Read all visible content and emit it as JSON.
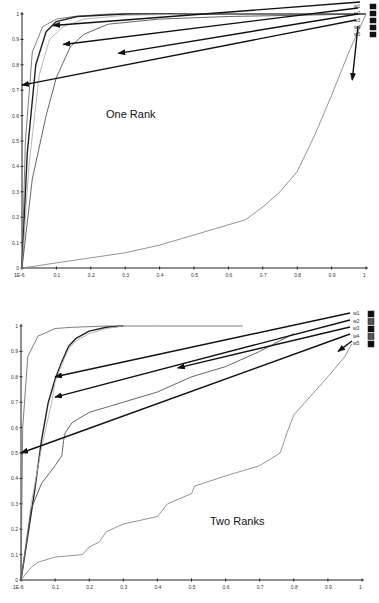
{
  "chart_data": [
    {
      "type": "line",
      "title": "",
      "annotation": "One Rank",
      "xlabel": "",
      "ylabel": "",
      "xlim": [
        0,
        1
      ],
      "ylim": [
        0,
        1
      ],
      "x_ticks": [
        "1E-6",
        "0.1",
        "0.2",
        "0.3",
        "0.4",
        "0.5",
        "0.6",
        "0.7",
        "0.8",
        "0.9",
        "1"
      ],
      "y_ticks": [
        "0",
        "0.1",
        "0.2",
        "0.3",
        "0.4",
        "0.5",
        "0.6",
        "0.7",
        "0.8",
        "0.9",
        "1"
      ],
      "grid": false,
      "legend_position": "top-right",
      "legend": [
        "w1",
        "w2",
        "w3",
        "w4",
        "w5"
      ],
      "series": [
        {
          "name": "w1",
          "x": [
            0,
            0.01,
            0.03,
            0.06,
            0.1,
            0.15,
            0.25,
            0.4,
            1.0
          ],
          "y": [
            0,
            0.5,
            0.85,
            0.95,
            0.98,
            0.99,
            1.0,
            1.0,
            1.0
          ]
        },
        {
          "name": "w2",
          "x": [
            0,
            0.015,
            0.04,
            0.07,
            0.1,
            0.16,
            0.3,
            0.5,
            1.0
          ],
          "y": [
            0,
            0.45,
            0.8,
            0.93,
            0.97,
            0.99,
            1.0,
            1.0,
            1.0
          ]
        },
        {
          "name": "w3",
          "x": [
            0,
            0.02,
            0.05,
            0.08,
            0.12,
            0.18,
            0.3,
            0.5,
            1.0
          ],
          "y": [
            0,
            0.4,
            0.76,
            0.9,
            0.95,
            0.98,
            0.995,
            1.0,
            1.0
          ]
        },
        {
          "name": "w4",
          "x": [
            0,
            0.03,
            0.07,
            0.1,
            0.14,
            0.18,
            0.25,
            0.4,
            0.6,
            1.0
          ],
          "y": [
            0,
            0.35,
            0.6,
            0.75,
            0.87,
            0.92,
            0.96,
            0.98,
            0.99,
            1.0
          ]
        },
        {
          "name": "w5",
          "x": [
            0,
            0.05,
            0.1,
            0.2,
            0.3,
            0.4,
            0.5,
            0.6,
            0.65,
            0.7,
            0.75,
            0.8,
            0.85,
            0.9,
            0.95,
            1.0
          ],
          "y": [
            0,
            0.01,
            0.02,
            0.04,
            0.06,
            0.09,
            0.13,
            0.17,
            0.19,
            0.24,
            0.3,
            0.38,
            0.52,
            0.68,
            0.85,
            1.0
          ]
        }
      ],
      "arrows_point_to": [
        {
          "series": "w1",
          "x": 0.09,
          "y": 0.955
        },
        {
          "series": "w2",
          "x": 0.12,
          "y": 0.88
        },
        {
          "series": "w3",
          "x": 0.28,
          "y": 0.845
        },
        {
          "series": "w4",
          "x": 0.0,
          "y": 0.72
        },
        {
          "series": "w5",
          "x": 0.96,
          "y": 0.74
        }
      ]
    },
    {
      "type": "line",
      "title": "",
      "annotation": "Two Ranks",
      "xlabel": "",
      "ylabel": "",
      "xlim": [
        0,
        1
      ],
      "ylim": [
        0,
        1
      ],
      "x_ticks": [
        "1E-6",
        "0.1",
        "0.2",
        "0.3",
        "0.4",
        "0.5",
        "0.6",
        "0.7",
        "0.8",
        "0.9",
        "1"
      ],
      "y_ticks": [
        "0",
        "0.1",
        "0.2",
        "0.3",
        "0.4",
        "0.5",
        "0.6",
        "0.7",
        "0.8",
        "0.9",
        "1"
      ],
      "grid": false,
      "legend_position": "top-right",
      "legend": [
        "w1",
        "w2",
        "w3",
        "w4",
        "w5"
      ],
      "series": [
        {
          "name": "w1",
          "x": [
            0,
            0.005,
            0.02,
            0.05,
            0.1,
            0.15,
            0.25,
            0.4,
            0.65
          ],
          "y": [
            0,
            0.6,
            0.88,
            0.96,
            0.99,
            0.995,
            1.0,
            1.0,
            1.0
          ]
        },
        {
          "name": "w2",
          "x": [
            0,
            0.04,
            0.06,
            0.08,
            0.1,
            0.12,
            0.14,
            0.16,
            0.2,
            0.25,
            0.3
          ],
          "y": [
            0,
            0.35,
            0.55,
            0.7,
            0.79,
            0.86,
            0.92,
            0.95,
            0.98,
            0.995,
            1.0
          ]
        },
        {
          "name": "w3",
          "x": [
            0,
            0.03,
            0.06,
            0.09,
            0.1,
            0.12,
            0.14,
            0.16,
            0.2,
            0.25,
            0.3
          ],
          "y": [
            0,
            0.3,
            0.52,
            0.7,
            0.78,
            0.85,
            0.91,
            0.94,
            0.97,
            0.99,
            1.0
          ]
        },
        {
          "name": "w4",
          "x": [
            0,
            0.03,
            0.06,
            0.1,
            0.12,
            0.125,
            0.13,
            0.15,
            0.2,
            0.3,
            0.4,
            0.5,
            0.6,
            0.7,
            0.8
          ],
          "y": [
            0,
            0.28,
            0.38,
            0.45,
            0.49,
            0.55,
            0.58,
            0.62,
            0.66,
            0.7,
            0.74,
            0.8,
            0.84,
            0.9,
            0.97
          ]
        },
        {
          "name": "w5",
          "x": [
            0,
            0.03,
            0.05,
            0.1,
            0.18,
            0.2,
            0.23,
            0.25,
            0.3,
            0.4,
            0.43,
            0.5,
            0.51,
            0.6,
            0.7,
            0.76,
            0.78,
            0.8,
            0.9,
            0.95,
            0.97
          ],
          "y": [
            0,
            0.05,
            0.07,
            0.09,
            0.1,
            0.13,
            0.15,
            0.19,
            0.22,
            0.25,
            0.3,
            0.34,
            0.37,
            0.41,
            0.45,
            0.5,
            0.58,
            0.65,
            0.8,
            0.88,
            0.93
          ]
        }
      ],
      "arrows_point_to": [
        {
          "series": "w1",
          "x": 0.1,
          "y": 0.8
        },
        {
          "series": "w2",
          "x": 0.1,
          "y": 0.72
        },
        {
          "series": "w3",
          "x": 0.46,
          "y": 0.835
        },
        {
          "series": "w4",
          "x": 0.0,
          "y": 0.5
        },
        {
          "series": "w5",
          "x": 0.93,
          "y": 0.9
        }
      ]
    }
  ],
  "legend_labels": [
    "w1",
    "w2",
    "w3",
    "w4",
    "w5"
  ],
  "colors": {
    "axis": "#222222",
    "arrow": "#111111",
    "w1": "#707070",
    "w2": "#222222",
    "w3": "#b0b0b0",
    "w4": "#555555",
    "w5": "#888888",
    "legend_swatch_dark": "#111111",
    "legend_swatch_mid": "#555555"
  }
}
